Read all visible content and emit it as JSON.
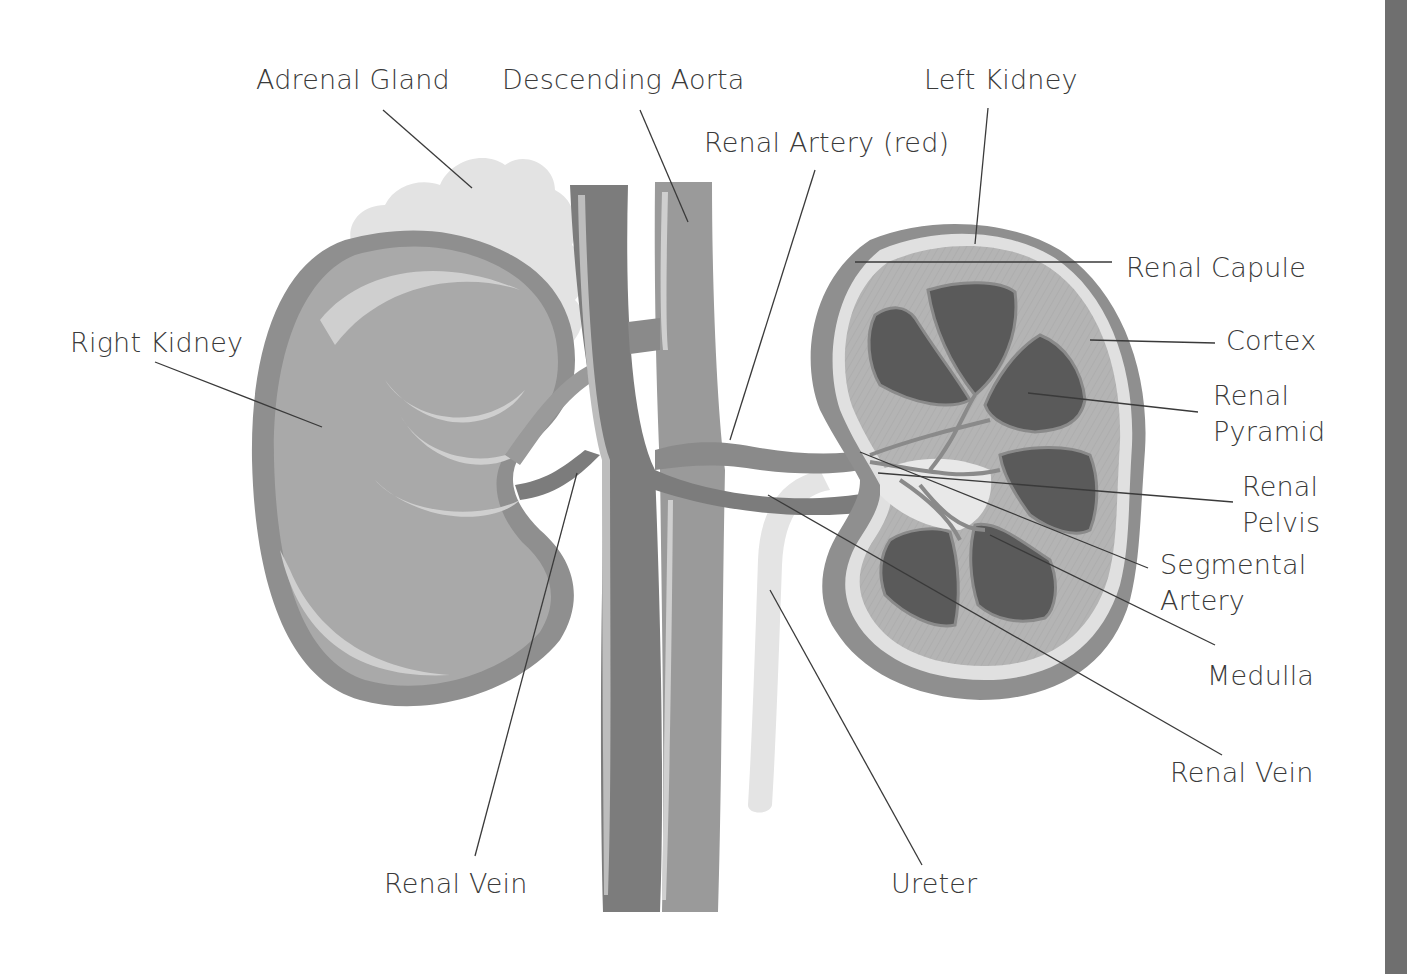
{
  "diagram": {
    "colors": {
      "background": "#ffffff",
      "label_text": "#3a3a3a",
      "leader_line": "#3a3a3a",
      "kidney_outer": "#8f8f8f",
      "kidney_body": "#a9a9a9",
      "kidney_highlight": "#cfcfcf",
      "adrenal": "#e3e3e3",
      "vein": "#7c7c7c",
      "aorta": "#9a9a9a",
      "cortex": "#b4b4b4",
      "pyramid": "#5a5a5a",
      "ureter": "#e4e4e4",
      "strip": "#6f6f6f"
    },
    "labels": {
      "adrenal_gland": "Adrenal Gland",
      "descending_aorta": "Descending Aorta",
      "left_kidney": "Left Kidney",
      "renal_artery": "Renal Artery (red)",
      "renal_capule": "Renal Capule",
      "right_kidney": "Right Kidney",
      "cortex": "Cortex",
      "renal_pyramid_1": "Renal",
      "renal_pyramid_2": "Pyramid",
      "renal_pelvis_1": "Renal",
      "renal_pelvis_2": "Pelvis",
      "segmental_artery_1": "Segmental",
      "segmental_artery_2": "Artery",
      "medulla": "Medulla",
      "renal_vein_right": "Renal Vein",
      "renal_vein_left": "Renal Vein",
      "ureter": "Ureter"
    }
  }
}
